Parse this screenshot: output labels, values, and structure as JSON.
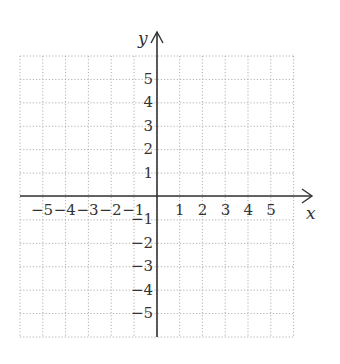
{
  "chart_data": {
    "type": "scatter",
    "title": "",
    "xlabel": "x",
    "ylabel": "y",
    "xlim": [
      -6,
      6
    ],
    "ylim": [
      -6,
      6
    ],
    "grid": true,
    "grid_style": "dotted",
    "x_ticks": [
      "−5",
      "−4",
      "−3",
      "−2",
      "−1",
      "1",
      "2",
      "3",
      "4",
      "5"
    ],
    "y_ticks": [
      "5",
      "4",
      "3",
      "2",
      "1",
      "−1",
      "−2",
      "−3",
      "−4",
      "−5"
    ],
    "x_tick_values": [
      -5,
      -4,
      -3,
      -2,
      -1,
      1,
      2,
      3,
      4,
      5
    ],
    "y_tick_values": [
      5,
      4,
      3,
      2,
      1,
      -1,
      -2,
      -3,
      -4,
      -5
    ],
    "series": []
  },
  "colors": {
    "axis": "#333333",
    "grid": "#b0b0b0",
    "text": "#333333"
  }
}
